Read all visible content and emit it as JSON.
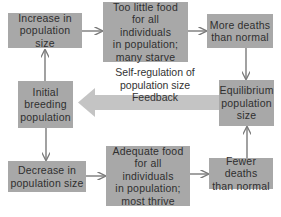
{
  "diagram": {
    "nodes": {
      "increase": {
        "label": "Increase in\npopulation size"
      },
      "too_little_food": {
        "label": "Too little food\nfor all individuals\nin population;\nmany starve"
      },
      "more_deaths": {
        "label": "More deaths\nthan normal"
      },
      "equilibrium": {
        "label": "Equilibrium\npopulation\nsize"
      },
      "initial": {
        "label": "Initial\nbreeding\npopulation"
      },
      "decrease": {
        "label": "Decrease in\npopulation size"
      },
      "adequate_food": {
        "label": "Adequate food\nfor all individuals\nin population;\nmost thrive"
      },
      "fewer_deaths": {
        "label": "Fewer deaths\nthan normal"
      }
    },
    "feedback": {
      "title": "Self-regulation of\npopulation size",
      "label": "Feedback"
    },
    "edges": [
      {
        "from": "initial",
        "to": "increase"
      },
      {
        "from": "increase",
        "to": "too_little_food"
      },
      {
        "from": "too_little_food",
        "to": "more_deaths"
      },
      {
        "from": "more_deaths",
        "to": "equilibrium"
      },
      {
        "from": "initial",
        "to": "decrease"
      },
      {
        "from": "decrease",
        "to": "adequate_food"
      },
      {
        "from": "adequate_food",
        "to": "fewer_deaths"
      },
      {
        "from": "fewer_deaths",
        "to": "equilibrium"
      },
      {
        "from": "equilibrium",
        "to": "initial",
        "type": "feedback"
      }
    ],
    "colors": {
      "box": "#a8a8a8",
      "arrow": "#7a7a7a",
      "feedback_arrow": "#c4c4c4",
      "text": "#2f2f2f"
    }
  }
}
